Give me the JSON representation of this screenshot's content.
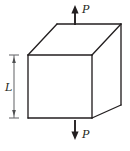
{
  "figure": {
    "name": "axially-loaded-cube-diagram",
    "colors": {
      "background": "#ffffff",
      "outline": "#231f20",
      "face_fill": "#ffffff",
      "dimension_line": "#58595b",
      "arrow": "#231f20",
      "text": "#231f20"
    },
    "labels": {
      "load_top": "P",
      "load_bottom": "P",
      "dimension_length": "L"
    },
    "geometry": {
      "front_face": {
        "left": 28,
        "top": 55,
        "right": 92,
        "bottom": 118
      },
      "depth_offset_x": 29,
      "depth_offset_y": -31,
      "back_top_left_x": 57,
      "back_top_left_y": 24,
      "back_top_right_x": 121,
      "back_top_right_y": 24,
      "back_bottom_right_x": 121,
      "back_bottom_right_y": 105
    },
    "arrows": {
      "top": {
        "x": 75,
        "tail_y": 25,
        "head_y": 6,
        "direction": "up",
        "label_x": 82,
        "label_y": 12
      },
      "bottom": {
        "x": 75,
        "tail_y": 120,
        "head_y": 139,
        "direction": "down",
        "label_x": 82,
        "label_y": 137
      }
    },
    "dimension": {
      "x": 14,
      "top_y": 55,
      "bottom_y": 118,
      "cap_half_width": 5,
      "label_x": 8,
      "label_y": 90
    }
  }
}
